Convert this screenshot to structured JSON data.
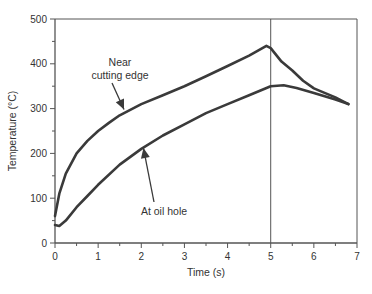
{
  "chart_data": {
    "type": "line",
    "title": "",
    "xlabel": "Time (s)",
    "ylabel": "Temperature (°C)",
    "xlim": [
      0,
      7
    ],
    "ylim": [
      0,
      500
    ],
    "xticks": [
      0,
      1,
      2,
      3,
      4,
      5,
      6,
      7
    ],
    "yticks": [
      0,
      100,
      200,
      300,
      400,
      500
    ],
    "grid": false,
    "legend": "none (inline annotations with arrows)",
    "vertical_line_x": 5,
    "series": [
      {
        "name": "Near cutting edge",
        "x": [
          0,
          0.1,
          0.25,
          0.5,
          0.75,
          1,
          1.25,
          1.5,
          2,
          2.5,
          3,
          3.5,
          4,
          4.5,
          4.9,
          5,
          5.25,
          5.5,
          5.75,
          6,
          6.25,
          6.5,
          6.8
        ],
        "values": [
          60,
          110,
          155,
          200,
          228,
          250,
          268,
          285,
          310,
          330,
          350,
          372,
          395,
          418,
          440,
          435,
          405,
          385,
          362,
          345,
          335,
          325,
          310
        ]
      },
      {
        "name": "At oil hole",
        "x": [
          0,
          0.1,
          0.25,
          0.5,
          0.75,
          1,
          1.5,
          2,
          2.5,
          3,
          3.5,
          4,
          4.5,
          5,
          5.3,
          5.6,
          6,
          6.5,
          6.8
        ],
        "values": [
          40,
          38,
          50,
          80,
          105,
          130,
          175,
          210,
          240,
          265,
          290,
          310,
          330,
          350,
          352,
          346,
          335,
          320,
          310
        ]
      }
    ],
    "annotations": [
      {
        "text_lines": [
          "Near",
          "cutting edge"
        ],
        "arrow_to": {
          "x": 1.6,
          "y": 298
        }
      },
      {
        "text_lines": [
          "At oil hole"
        ],
        "arrow_to": {
          "x": 2.05,
          "y": 212
        }
      }
    ]
  },
  "labels": {
    "xlabel": "Time (s)",
    "ylabel": "Temperature (°C)",
    "annotation_near_line1": "Near",
    "annotation_near_line2": "cutting edge",
    "annotation_oil": "At oil hole"
  },
  "colors": {
    "curve": "#3a3a3a",
    "axis": "#555555",
    "text": "#333333"
  }
}
